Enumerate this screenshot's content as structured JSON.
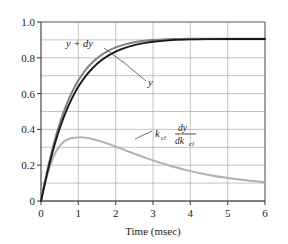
{
  "chart_data": {
    "type": "line",
    "title": "",
    "xlabel": "Time (msec)",
    "ylabel": "",
    "xlim": [
      0,
      6
    ],
    "ylim": [
      0,
      1.0
    ],
    "xticks": [
      "0",
      "1",
      "2",
      "3",
      "4",
      "5",
      "6"
    ],
    "xtick_values": [
      0,
      1,
      2,
      3,
      4,
      5,
      6
    ],
    "yticks": [
      "0",
      "0.2",
      "0.4",
      "0.6",
      "0.8",
      "1.0"
    ],
    "ytick_values": [
      0,
      0.2,
      0.4,
      0.6,
      0.8,
      1.0
    ],
    "grid": true,
    "grid_x_step": 1,
    "grid_y_step": 0.1,
    "legend": "inline-annotations",
    "series": [
      {
        "name": "y",
        "label": "y",
        "color": "#1a1a1a",
        "x": [
          0,
          0.1,
          0.2,
          0.3,
          0.4,
          0.5,
          0.6,
          0.7,
          0.8,
          0.9,
          1.0,
          1.2,
          1.4,
          1.6,
          1.8,
          2.0,
          2.25,
          2.5,
          2.75,
          3.0,
          3.5,
          4.0,
          4.5,
          5.0,
          5.5,
          6.0
        ],
        "values": [
          0.0,
          0.095,
          0.185,
          0.266,
          0.339,
          0.405,
          0.463,
          0.515,
          0.561,
          0.602,
          0.639,
          0.699,
          0.746,
          0.783,
          0.812,
          0.834,
          0.855,
          0.871,
          0.882,
          0.89,
          0.899,
          0.903,
          0.9045,
          0.905,
          0.905,
          0.905
        ]
      },
      {
        "name": "y_plus_dy",
        "label": "y + dy",
        "color": "#808080",
        "x": [
          0,
          0.1,
          0.2,
          0.3,
          0.4,
          0.5,
          0.6,
          0.7,
          0.8,
          0.9,
          1.0,
          1.2,
          1.4,
          1.6,
          1.8,
          2.0,
          2.25,
          2.5,
          2.75,
          3.0,
          3.5,
          4.0,
          4.5,
          5.0,
          5.5,
          6.0
        ],
        "values": [
          0.0,
          0.103,
          0.199,
          0.286,
          0.363,
          0.432,
          0.493,
          0.547,
          0.595,
          0.637,
          0.674,
          0.734,
          0.779,
          0.813,
          0.839,
          0.858,
          0.875,
          0.887,
          0.895,
          0.9,
          0.905,
          0.907,
          0.907,
          0.907,
          0.906,
          0.906
        ]
      },
      {
        "name": "sensitivity",
        "label": "k_cl dy/dk_cl",
        "label_base": "k",
        "label_base_sub": "cl",
        "label_num": "dy",
        "label_den_base": "dk",
        "label_den_sub": "cl",
        "color": "#b0b0b0",
        "x": [
          0,
          0.1,
          0.2,
          0.3,
          0.4,
          0.5,
          0.6,
          0.7,
          0.8,
          0.9,
          1.0,
          1.1,
          1.2,
          1.4,
          1.6,
          1.8,
          2.0,
          2.25,
          2.5,
          2.75,
          3.0,
          3.5,
          4.0,
          4.5,
          5.0,
          5.5,
          6.0
        ],
        "values": [
          0.0,
          0.092,
          0.168,
          0.229,
          0.275,
          0.307,
          0.329,
          0.343,
          0.351,
          0.354,
          0.355,
          0.3555,
          0.354,
          0.345,
          0.333,
          0.319,
          0.304,
          0.284,
          0.264,
          0.245,
          0.227,
          0.194,
          0.167,
          0.145,
          0.128,
          0.116,
          0.105
        ]
      }
    ],
    "annotations": [
      {
        "name": "label-y-plus-dy",
        "text": "y + dy",
        "x": 1.0,
        "y": 0.875
      },
      {
        "name": "label-y",
        "text": "y",
        "x": 2.45,
        "y": 0.66
      },
      {
        "name": "label-sensitivity",
        "text": "k_cl dy/dk_cl",
        "x": 3.5,
        "y": 0.285
      }
    ]
  },
  "axes": {
    "x_title": "Time (msec)"
  }
}
